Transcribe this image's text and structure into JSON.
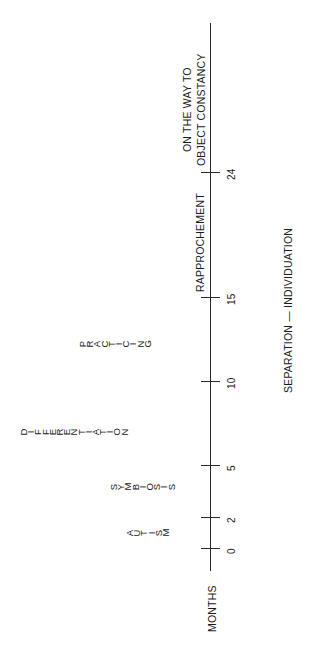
{
  "diagram": {
    "axis": {
      "label": "MONTHS",
      "ticks": [
        {
          "value": "0",
          "y": 549
        },
        {
          "value": "2",
          "y": 518
        },
        {
          "value": "5",
          "y": 466
        },
        {
          "value": "10",
          "y": 382
        },
        {
          "value": "15",
          "y": 298
        },
        {
          "value": "24",
          "y": 173
        }
      ]
    },
    "stages": [
      {
        "name": "AUTISM",
        "layout": "stacked-letters"
      },
      {
        "name": "SYMBIOSIS",
        "layout": "stacked-letters"
      },
      {
        "name": "DIFFERENTIATION",
        "layout": "stacked-letters"
      },
      {
        "name": "PRACTICING",
        "layout": "stacked-letters"
      },
      {
        "name": "RAPPROCHEMENT",
        "layout": "rotated"
      },
      {
        "name_line1": "ON THE WAY TO",
        "name_line2": "OBJECT CONSTANCY",
        "layout": "rotated"
      }
    ],
    "title": "SEPARATION — INDIVIDUATION"
  }
}
